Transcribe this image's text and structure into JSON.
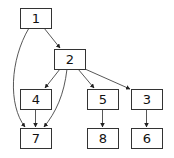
{
  "diagram": {
    "type": "directed-graph",
    "nodes": [
      {
        "id": "1",
        "label": "1",
        "x": 20,
        "y": 8,
        "w": 31,
        "h": 20
      },
      {
        "id": "2",
        "label": "2",
        "x": 54,
        "y": 49,
        "w": 31,
        "h": 20
      },
      {
        "id": "4",
        "label": "4",
        "x": 20,
        "y": 89,
        "w": 31,
        "h": 20
      },
      {
        "id": "5",
        "label": "5",
        "x": 87,
        "y": 89,
        "w": 31,
        "h": 20
      },
      {
        "id": "3",
        "label": "3",
        "x": 131,
        "y": 89,
        "w": 31,
        "h": 20
      },
      {
        "id": "7",
        "label": "7",
        "x": 20,
        "y": 128,
        "w": 31,
        "h": 20
      },
      {
        "id": "8",
        "label": "8",
        "x": 87,
        "y": 128,
        "w": 31,
        "h": 20
      },
      {
        "id": "6",
        "label": "6",
        "x": 131,
        "y": 128,
        "w": 31,
        "h": 20
      }
    ],
    "edges": [
      {
        "from": "1",
        "to": "2"
      },
      {
        "from": "1",
        "to": "7"
      },
      {
        "from": "2",
        "to": "4"
      },
      {
        "from": "2",
        "to": "7"
      },
      {
        "from": "2",
        "to": "5"
      },
      {
        "from": "2",
        "to": "3"
      },
      {
        "from": "4",
        "to": "7"
      },
      {
        "from": "5",
        "to": "8"
      },
      {
        "from": "3",
        "to": "6"
      }
    ]
  }
}
